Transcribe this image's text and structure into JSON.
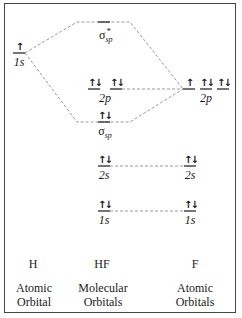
{
  "diagram": {
    "columns": {
      "left": {
        "atom": "H",
        "caption_line1": "Atomic",
        "caption_line2": "Orbital"
      },
      "middle": {
        "atom": "HF",
        "caption_line1": "Molecular",
        "caption_line2": "Orbitals"
      },
      "right": {
        "atom": "F",
        "caption_line1": "Atomic",
        "caption_line2": "Orbitals"
      }
    },
    "levels": {
      "h_1s": {
        "label": "1s",
        "electrons": "↑"
      },
      "sigma_star": {
        "label": "σ",
        "sub": "sp",
        "sup": "*",
        "electrons": ""
      },
      "hf_2p_a": {
        "electrons": "↑↓"
      },
      "hf_2p_b": {
        "electrons": "↑↓"
      },
      "hf_2p_label": "2p",
      "f_2p_a": {
        "electrons": "↑"
      },
      "f_2p_b": {
        "electrons": "↑↓"
      },
      "f_2p_c": {
        "electrons": "↑↓"
      },
      "f_2p_label": "2p",
      "sigma": {
        "label": "σ",
        "sub": "sp",
        "electrons": "↑↓"
      },
      "hf_2s": {
        "label": "2s",
        "electrons": "↑↓"
      },
      "f_2s": {
        "label": "2s",
        "electrons": "↑↓"
      },
      "hf_1s": {
        "label": "1s",
        "electrons": "↑↓"
      },
      "f_1s": {
        "label": "1s",
        "electrons": "↑↓"
      }
    },
    "colors": {
      "dashed": "#9a9a9a",
      "level": "#1a1a1a",
      "frame": "#444444"
    }
  }
}
